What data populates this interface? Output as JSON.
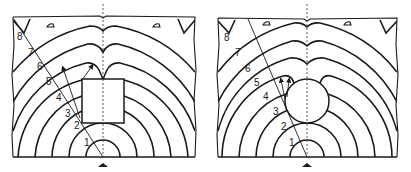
{
  "figure": {
    "colors": {
      "line": "#1a1a1a",
      "background": "#ffffff"
    },
    "panels": [
      {
        "id": "left",
        "obstacle": "square",
        "wavefront_labels": [
          "1",
          "2",
          "3",
          "4",
          "5",
          "6",
          "7",
          "8"
        ],
        "source_marker": "source-icon"
      },
      {
        "id": "right",
        "obstacle": "circle",
        "wavefront_labels": [
          "1",
          "2",
          "3",
          "4",
          "5",
          "6",
          "7",
          "8"
        ],
        "source_marker": "source-icon"
      }
    ]
  }
}
